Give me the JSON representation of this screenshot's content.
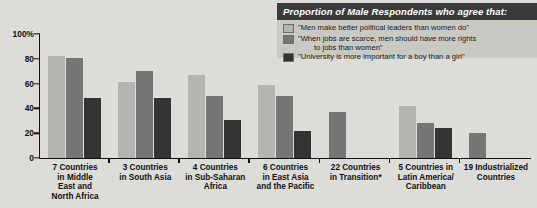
{
  "legend": {
    "header": "Proportion of Male Respondents who agree that:",
    "items": [
      {
        "color": "#b4b4b0",
        "label": "\"Men make better political leaders than women do\"",
        "label_cont": ""
      },
      {
        "color": "#767676",
        "label": "\"When jobs are scarce, men should have more rights",
        "label_cont": "to jobs than women\""
      },
      {
        "color": "#333333",
        "label": "\"University is more important for a boy than a girl\"",
        "label_cont": ""
      }
    ]
  },
  "chart_data": {
    "type": "bar",
    "title": "Proportion of Male Respondents who agree that:",
    "xlabel": "",
    "ylabel": "",
    "ylim": [
      0,
      100
    ],
    "yticks": [
      "0",
      "20",
      "40",
      "60",
      "80",
      "100%"
    ],
    "grid": false,
    "legend_position": "top-right",
    "categories": [
      "7 Countries in Middle East and North Africa",
      "3 Countries in South Asia",
      "4 Countries in Sub-Saharan Africa",
      "6 Countries in East Asia and the Pacific",
      "22 Countries in Transition*",
      "5 Countries in Latin America/ Caribbean",
      "19 Industrialized Countries"
    ],
    "category_lines": [
      [
        "7 Countries",
        "in Middle",
        "East and",
        "North Africa"
      ],
      [
        "3 Countries",
        "in South Asia"
      ],
      [
        "4 Countries",
        "in Sub-Saharan",
        "Africa"
      ],
      [
        "6 Countries",
        "in East Asia",
        "and the Pacific"
      ],
      [
        "22 Countries",
        "in Transition*"
      ],
      [
        "5 Countries in",
        "Latin America/",
        "Caribbean"
      ],
      [
        "19 Industrialized",
        "Countries"
      ]
    ],
    "series": [
      {
        "name": "\"Men make better political leaders than women do\"",
        "color": "#b4b4b0",
        "values": [
          82,
          61,
          67,
          59,
          null,
          42,
          null
        ]
      },
      {
        "name": "\"When jobs are scarce, men should have more rights to jobs than women\"",
        "color": "#767676",
        "values": [
          81,
          70,
          50,
          50,
          37,
          28,
          20
        ]
      },
      {
        "name": "\"University is more important for a boy than a girl\"",
        "color": "#333333",
        "values": [
          48,
          48,
          31,
          22,
          null,
          24,
          null
        ]
      }
    ]
  }
}
